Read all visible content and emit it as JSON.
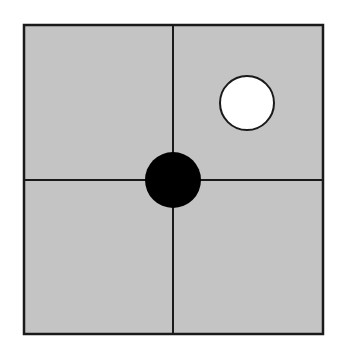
{
  "board": {
    "size": "2x2",
    "background_color": "#c4c4c4",
    "line_color": "#1a1a1a",
    "left": 24,
    "top": 25,
    "right": 323,
    "bottom": 334,
    "center_x": 173,
    "center_y": 180
  },
  "stones": [
    {
      "color": "black",
      "fill": "#000000",
      "cx": 173,
      "cy": 180,
      "r": 28,
      "position": "center-intersection"
    },
    {
      "color": "white",
      "fill": "#ffffff",
      "cx": 247,
      "cy": 103,
      "r": 28,
      "position": "upper-right-cell"
    }
  ]
}
